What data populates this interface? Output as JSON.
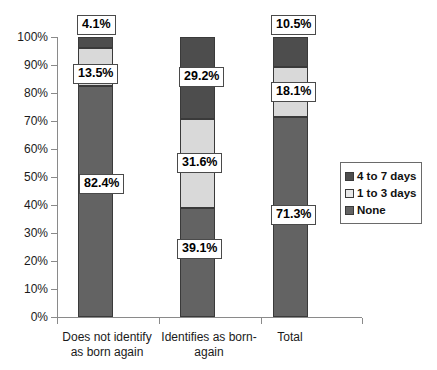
{
  "chart_data": {
    "type": "bar",
    "subtype": "stacked-percent-column",
    "title": "",
    "xlabel": "",
    "ylabel": "",
    "ylim": [
      0,
      100
    ],
    "grid": false,
    "legend_position": "right",
    "categories": [
      "Does not identify as born again",
      "Identifies as born-again",
      "Total"
    ],
    "category_lines": [
      [
        "Does not identify",
        "as born again"
      ],
      [
        "Identifies as born-",
        "again"
      ],
      [
        "Total"
      ]
    ],
    "y_ticks": [
      "0%",
      "10%",
      "20%",
      "30%",
      "40%",
      "50%",
      "60%",
      "70%",
      "80%",
      "90%",
      "100%"
    ],
    "y_tick_values": [
      0,
      10,
      20,
      30,
      40,
      50,
      60,
      70,
      80,
      90,
      100
    ],
    "series": [
      {
        "name": "None",
        "color": "#636363",
        "values": [
          82.4,
          39.1,
          71.3
        ],
        "labels": [
          "82.4%",
          "39.1%",
          "71.3%"
        ]
      },
      {
        "name": "1 to 3 days",
        "color": "#d9d9d9",
        "values": [
          13.5,
          31.6,
          18.1
        ],
        "labels": [
          "13.5%",
          "31.6%",
          "18.1%"
        ]
      },
      {
        "name": "4 to 7 days",
        "color": "#4d4d4d",
        "values": [
          4.1,
          29.2,
          10.5
        ],
        "labels": [
          "4.1%",
          "29.2%",
          "10.5%"
        ]
      }
    ],
    "legend_entries": [
      {
        "label": "4 to 7 days",
        "color": "#4d4d4d"
      },
      {
        "label": "1 to 3 days",
        "color": "#e8e8e8"
      },
      {
        "label": "None",
        "color": "#636363"
      }
    ],
    "data_labels": [
      {
        "text": "4.1%",
        "series": "4 to 7 days",
        "category": "Does not identify as born again"
      },
      {
        "text": "13.5%",
        "series": "1 to 3 days",
        "category": "Does not identify as born again"
      },
      {
        "text": "82.4%",
        "series": "None",
        "category": "Does not identify as born again"
      },
      {
        "text": "29.2%",
        "series": "4 to 7 days",
        "category": "Identifies as born-again"
      },
      {
        "text": "31.6%",
        "series": "1 to 3 days",
        "category": "Identifies as born-again"
      },
      {
        "text": "39.1%",
        "series": "None",
        "category": "Identifies as born-again"
      },
      {
        "text": "10.5%",
        "series": "4 to 7 days",
        "category": "Total"
      },
      {
        "text": "18.1%",
        "series": "1 to 3 days",
        "category": "Total"
      },
      {
        "text": "71.3%",
        "series": "None",
        "category": "Total"
      }
    ]
  },
  "layout": {
    "bar_x": [
      21,
      123,
      216
    ],
    "bar_width": 35,
    "plot_height": 280,
    "label_positions": [
      {
        "idx": 0,
        "left": 20,
        "top": -22
      },
      {
        "idx": 1,
        "left": 16,
        "top": 27
      },
      {
        "idx": 2,
        "left": 22,
        "top": 137
      },
      {
        "idx": 3,
        "left": 122,
        "top": 30
      },
      {
        "idx": 4,
        "left": 120,
        "top": 116
      },
      {
        "idx": 5,
        "left": 120,
        "top": 202
      },
      {
        "idx": 6,
        "left": 214,
        "top": -22
      },
      {
        "idx": 7,
        "left": 214,
        "top": 45
      },
      {
        "idx": 8,
        "left": 214,
        "top": 168
      }
    ],
    "cat_label_boxes": [
      {
        "left": 52,
        "width": 110
      },
      {
        "left": 155,
        "width": 108
      },
      {
        "left": 250,
        "width": 80
      }
    ]
  }
}
